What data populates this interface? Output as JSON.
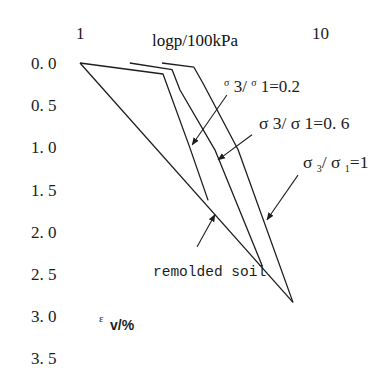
{
  "chart_data": {
    "type": "line",
    "title": "",
    "xlabel": "logp/100kPa",
    "ylabel": "εv/%",
    "xscale": "log",
    "xlim": [
      1,
      10
    ],
    "ylim": [
      0,
      3.5
    ],
    "y_inverted": true,
    "x_axis_position": "top",
    "grid": false,
    "legend": null,
    "xticks": [
      1,
      10
    ],
    "xtick_labels": [
      "1",
      "10"
    ],
    "yticks": [
      0.0,
      0.5,
      1.0,
      1.5,
      2.0,
      2.5,
      3.0,
      3.5
    ],
    "ytick_labels": [
      "0. 0",
      "0. 5",
      "1. 0",
      "1. 5",
      "2. 0",
      "2. 5",
      "3. 0",
      "3. 5"
    ],
    "series": [
      {
        "name": "remolded soil",
        "p": [
          1.0,
          7.65
        ],
        "ev": [
          0.0,
          2.84
        ]
      },
      {
        "name": "σ3/σ1=0.2",
        "p": [
          1.0,
          2.21,
          2.86,
          3.4
        ],
        "ev": [
          0.0,
          0.13,
          1.01,
          1.63
        ]
      },
      {
        "name": "σ3/σ1=0.6",
        "p": [
          1.61,
          2.41,
          2.6,
          3.63,
          5.69
        ],
        "ev": [
          0.0,
          0.08,
          0.32,
          1.03,
          2.4
        ]
      },
      {
        "name": "σ3/σ1=1",
        "p": [
          2.19,
          2.97,
          3.24,
          4.53,
          7.65
        ],
        "ev": [
          0.0,
          0.05,
          0.24,
          1.03,
          2.84
        ]
      }
    ],
    "annotations": [
      {
        "text": "σ3/σ1=0.2",
        "series": "σ3/σ1=0.2",
        "arrow_from": [
          4.07,
          0.38
        ],
        "arrow_to": [
          2.92,
          0.97
        ]
      },
      {
        "text": "σ3/σ1=0.6",
        "series": "σ3/σ1=0.6",
        "arrow_from": [
          5.17,
          0.85
        ],
        "arrow_to": [
          3.74,
          1.15
        ]
      },
      {
        "text": "σ3/σ1=1",
        "series": "σ3/σ1=1",
        "arrow_from": [
          8.03,
          1.33
        ],
        "arrow_to": [
          5.97,
          1.86
        ]
      },
      {
        "text": "remolded soil",
        "series": "remolded soil",
        "arrow_from": [
          3.06,
          2.18
        ],
        "arrow_to": [
          3.63,
          1.8
        ]
      }
    ]
  },
  "labels": {
    "ann_02": {
      "s1": "σ",
      "p1": " 3/ ",
      "s2": "σ",
      "p2": " 1=0.2"
    },
    "ann_06": {
      "text": "σ 3/ σ 1=0. 6"
    },
    "ann_10": {
      "s1": "σ ",
      "sub1": "3",
      "mid": "/ σ ",
      "sub2": "1",
      "end": "=1"
    },
    "ann_remolded": {
      "text": "remolded soil"
    },
    "ylabel": {
      "eps": "ε",
      "unit": "v/%"
    }
  },
  "style": {
    "line_color": "#1e1e1e",
    "text_color": "#1c1c1c",
    "background": "#ffffff"
  }
}
